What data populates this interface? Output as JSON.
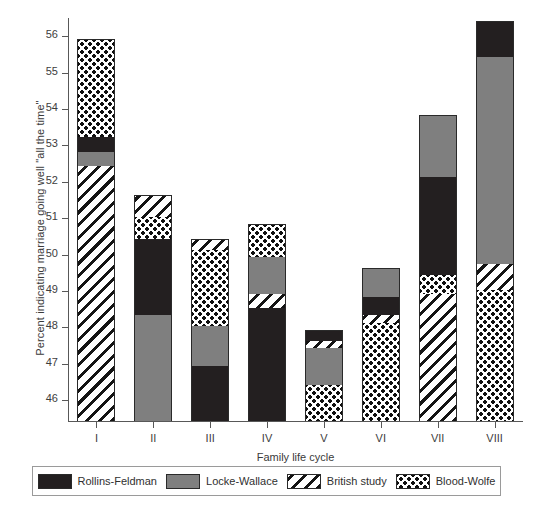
{
  "chart_data": {
    "type": "bar",
    "subtype": "stacked",
    "title": "",
    "xlabel": "Family life cycle",
    "ylabel": "Percent indicating marriage going well \"all the time\"",
    "categories": [
      "I",
      "II",
      "III",
      "IV",
      "V",
      "VI",
      "VII",
      "VIII"
    ],
    "ylim": [
      45.4,
      56.5
    ],
    "yticks": [
      46,
      47,
      48,
      49,
      50,
      51,
      52,
      53,
      54,
      55,
      56
    ],
    "ytick_labels": [
      "46",
      "47",
      "48",
      "49",
      "50",
      "51",
      "52",
      "53",
      "54",
      "55",
      "56"
    ],
    "grid": false,
    "legend_position": "bottom",
    "series": [
      {
        "name": "Rollins-Feldman",
        "pattern": "solid-black",
        "color": "#231f20",
        "values": [
          55.9,
          50.4,
          46.9,
          48.5,
          47.9,
          48.8,
          52.1,
          56.4
        ]
      },
      {
        "name": "Locke-Wallace",
        "pattern": "solid-gray",
        "color": "#7f7f7f",
        "values": [
          52.8,
          48.3,
          48.0,
          50.3,
          47.4,
          49.6,
          53.8,
          55.4
        ]
      },
      {
        "name": "British study",
        "pattern": "diagonal-hatch",
        "color": "#ffffff",
        "values": [
          52.4,
          51.6,
          51.4,
          48.9,
          47.6,
          48.3,
          48.9,
          49.7
        ]
      },
      {
        "name": "Blood-Wolfe",
        "pattern": "checkered-dots",
        "color": "#ffffff",
        "values": [
          55.9,
          51.0,
          51.4,
          50.8,
          46.4,
          48.1,
          49.4,
          49.0
        ]
      }
    ],
    "stack_order_note": "Each bar's segment boundaries are the cumulative top edge of each stacked band, in the drawing order listed per bar.",
    "bars": [
      {
        "category": "I",
        "total_top": 55.9,
        "segments": [
          {
            "series": "British study",
            "bottom": 45.4,
            "top": 52.4
          },
          {
            "series": "Locke-Wallace",
            "bottom": 52.4,
            "top": 52.8
          },
          {
            "series": "Rollins-Feldman",
            "bottom": 52.8,
            "top": 53.2
          },
          {
            "series": "Blood-Wolfe",
            "bottom": 53.2,
            "top": 55.9
          }
        ]
      },
      {
        "category": "II",
        "total_top": 51.6,
        "segments": [
          {
            "series": "Locke-Wallace",
            "bottom": 45.4,
            "top": 48.3
          },
          {
            "series": "Rollins-Feldman",
            "bottom": 48.3,
            "top": 50.4
          },
          {
            "series": "Blood-Wolfe",
            "bottom": 50.4,
            "top": 51.0
          },
          {
            "series": "British study",
            "bottom": 51.0,
            "top": 51.6
          }
        ]
      },
      {
        "category": "III",
        "total_top": 50.4,
        "segments": [
          {
            "series": "Rollins-Feldman",
            "bottom": 45.4,
            "top": 46.9
          },
          {
            "series": "Locke-Wallace",
            "bottom": 46.9,
            "top": 48.0
          },
          {
            "series": "Blood-Wolfe",
            "bottom": 48.0,
            "top": 50.1
          },
          {
            "series": "British study",
            "bottom": 50.1,
            "top": 50.4
          }
        ]
      },
      {
        "category": "IV",
        "total_top": 50.8,
        "segments": [
          {
            "series": "Rollins-Feldman",
            "bottom": 45.4,
            "top": 48.5
          },
          {
            "series": "British study",
            "bottom": 48.5,
            "top": 48.9
          },
          {
            "series": "Locke-Wallace",
            "bottom": 48.9,
            "top": 49.9
          },
          {
            "series": "Blood-Wolfe",
            "bottom": 49.9,
            "top": 50.8
          }
        ]
      },
      {
        "category": "V",
        "total_top": 47.9,
        "segments": [
          {
            "series": "Blood-Wolfe",
            "bottom": 45.4,
            "top": 46.4
          },
          {
            "series": "Locke-Wallace",
            "bottom": 46.4,
            "top": 47.4
          },
          {
            "series": "British study",
            "bottom": 47.4,
            "top": 47.6
          },
          {
            "series": "Rollins-Feldman",
            "bottom": 47.6,
            "top": 47.9
          }
        ]
      },
      {
        "category": "VI",
        "total_top": 49.6,
        "segments": [
          {
            "series": "Blood-Wolfe",
            "bottom": 45.4,
            "top": 48.1
          },
          {
            "series": "British study",
            "bottom": 48.1,
            "top": 48.3
          },
          {
            "series": "Rollins-Feldman",
            "bottom": 48.3,
            "top": 48.8
          },
          {
            "series": "Locke-Wallace",
            "bottom": 48.8,
            "top": 49.6
          }
        ]
      },
      {
        "category": "VII",
        "total_top": 53.8,
        "segments": [
          {
            "series": "British study",
            "bottom": 45.4,
            "top": 48.9
          },
          {
            "series": "Blood-Wolfe",
            "bottom": 48.9,
            "top": 49.4
          },
          {
            "series": "Rollins-Feldman",
            "bottom": 49.4,
            "top": 52.1
          },
          {
            "series": "Locke-Wallace",
            "bottom": 52.1,
            "top": 53.8
          }
        ]
      },
      {
        "category": "VIII",
        "total_top": 56.4,
        "segments": [
          {
            "series": "Blood-Wolfe",
            "bottom": 45.4,
            "top": 49.0
          },
          {
            "series": "British study",
            "bottom": 49.0,
            "top": 49.7
          },
          {
            "series": "Locke-Wallace",
            "bottom": 49.7,
            "top": 55.4
          },
          {
            "series": "Rollins-Feldman",
            "bottom": 55.4,
            "top": 56.4
          }
        ]
      }
    ]
  },
  "legend": {
    "items": [
      {
        "label": "Rollins-Feldman",
        "pattern": "solid-black"
      },
      {
        "label": "Locke-Wallace",
        "pattern": "solid-gray"
      },
      {
        "label": "British study",
        "pattern": "diagonal-hatch"
      },
      {
        "label": "Blood-Wolfe",
        "pattern": "checkered-dots"
      }
    ]
  }
}
